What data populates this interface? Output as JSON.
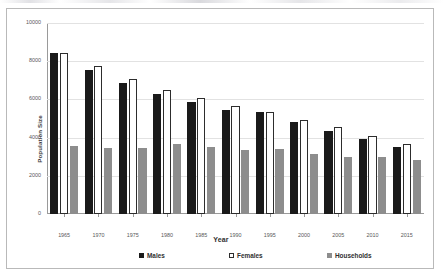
{
  "chart_data": {
    "type": "bar",
    "title": "",
    "xlabel": "Year",
    "ylabel": "Population Size",
    "ylim": [
      0,
      10000
    ],
    "yticks": [
      0,
      2000,
      4000,
      6000,
      8000,
      10000
    ],
    "ytick_labels": [
      "0",
      "2000",
      "4000",
      "6000",
      "8000",
      "10000"
    ],
    "grid": true,
    "legend_position": "bottom",
    "categories": [
      "1965",
      "1970",
      "1975",
      "1980",
      "1985",
      "1990",
      "1995",
      "2000",
      "2005",
      "2010",
      "2015"
    ],
    "series": [
      {
        "name": "Males",
        "color": "#1a1a1a",
        "values": [
          8450,
          7550,
          6850,
          6280,
          5840,
          5470,
          5330,
          4830,
          4370,
          3920,
          3510
        ]
      },
      {
        "name": "Females",
        "color": "#ffffff",
        "values": [
          8440,
          7740,
          7080,
          6500,
          6060,
          5660,
          5330,
          4930,
          4530,
          4100,
          3660
        ]
      },
      {
        "name": "Households",
        "color": "#8d8d8d",
        "values": [
          3580,
          3480,
          3440,
          3650,
          3490,
          3370,
          3390,
          3160,
          3010,
          2960,
          2850
        ]
      }
    ]
  },
  "legend": {
    "items": [
      {
        "label": "Males",
        "swatch": "filled-black-square-icon"
      },
      {
        "label": "Females",
        "swatch": "outline-white-square-icon"
      },
      {
        "label": "Households",
        "swatch": "filled-gray-square-icon"
      }
    ]
  }
}
